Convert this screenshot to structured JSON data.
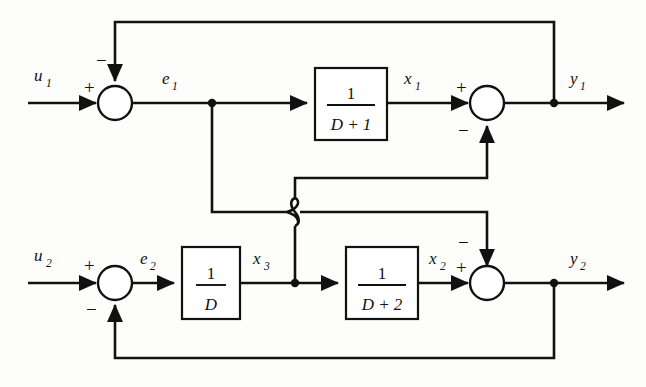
{
  "figure": {
    "type": "control-block-diagram",
    "background_color": "#fdfdfb",
    "line_color": "#111111"
  },
  "signals": {
    "u1": {
      "label": "u",
      "subscript": "1"
    },
    "u2": {
      "label": "u",
      "subscript": "2"
    },
    "e1": {
      "label": "e",
      "subscript": "1"
    },
    "e2": {
      "label": "e",
      "subscript": "2"
    },
    "x1": {
      "label": "x",
      "subscript": "1"
    },
    "x2": {
      "label": "x",
      "subscript": "2"
    },
    "x3": {
      "label": "x",
      "subscript": "3"
    },
    "y1": {
      "label": "y",
      "subscript": "1"
    },
    "y2": {
      "label": "y",
      "subscript": "2"
    }
  },
  "blocks": [
    {
      "id": "block-1-over-d-plus-1",
      "numerator": "1",
      "denominator": "D + 1",
      "x": 315,
      "y": 68,
      "w": 72,
      "h": 72
    },
    {
      "id": "block-1-over-d",
      "numerator": "1",
      "denominator": "D",
      "x": 182,
      "y": 247,
      "w": 58,
      "h": 72
    },
    {
      "id": "block-1-over-d-plus-2",
      "numerator": "1",
      "denominator": "D + 2",
      "x": 346,
      "y": 247,
      "w": 72,
      "h": 72
    }
  ],
  "summing_junctions": [
    {
      "id": "sum-1",
      "cx": 115,
      "cy": 103,
      "r": 17,
      "inputs": [
        {
          "sign": "+",
          "from": "u1"
        },
        {
          "sign": "−",
          "from": "top-feedback-y1"
        }
      ]
    },
    {
      "id": "sum-2",
      "cx": 487,
      "cy": 103,
      "r": 17,
      "inputs": [
        {
          "sign": "+",
          "from": "x1"
        },
        {
          "sign": "−",
          "from": "x3-cross"
        }
      ]
    },
    {
      "id": "sum-3",
      "cx": 115,
      "cy": 283,
      "r": 17,
      "inputs": [
        {
          "sign": "+",
          "from": "u2"
        },
        {
          "sign": "−",
          "from": "bottom-feedback-y2"
        }
      ]
    },
    {
      "id": "sum-4",
      "cx": 487,
      "cy": 283,
      "r": 17,
      "inputs": [
        {
          "sign": "+",
          "from": "x2"
        },
        {
          "sign": "−",
          "from": "e1-cross"
        }
      ]
    }
  ],
  "signs": {
    "plus": "+",
    "minus": "−"
  },
  "nodes": [
    {
      "id": "node-e1",
      "x": 212,
      "y": 103
    },
    {
      "id": "node-y1",
      "x": 554,
      "y": 103
    },
    {
      "id": "node-x3",
      "x": 295,
      "y": 283
    },
    {
      "id": "node-y2",
      "x": 554,
      "y": 283
    }
  ],
  "crossover": {
    "id": "wire-hop",
    "x": 295,
    "y": 212,
    "description": "e1 horizontal branch hops over the x3 vertical branch"
  },
  "equations_implied": {
    "e1": "u1 - y1",
    "x1": "e1 / (D + 1)",
    "y1": "x1 - x3",
    "e2": "u2 - y2",
    "x3": "e2 / D",
    "x2": "x3 / (D + 2)",
    "y2": "x2 - e1"
  }
}
